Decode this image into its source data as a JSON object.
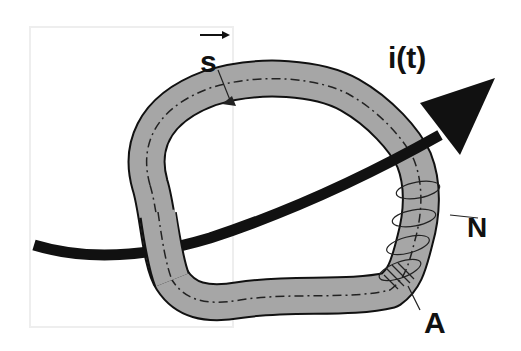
{
  "diagram": {
    "type": "magnetic core loop with current-carrying conductor and winding",
    "labels": {
      "path_vector": "s",
      "current": "i(t)",
      "turns": "N",
      "area": "A"
    },
    "colors": {
      "core_fill": "#a6a6a6",
      "outline": "#111111",
      "conductor": "#111111",
      "frame": "#e6e6e6",
      "background": "#ffffff"
    }
  }
}
